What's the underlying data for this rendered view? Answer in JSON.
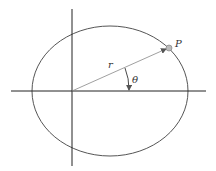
{
  "diagram": {
    "type": "polar-coordinates-ellipse",
    "labels": {
      "point": "P",
      "radius": "r",
      "angle": "θ"
    },
    "colors": {
      "ellipse": "#555555",
      "axes": "#222222",
      "radius_line": "#888888",
      "point_fill": "#bbbbbb"
    }
  }
}
